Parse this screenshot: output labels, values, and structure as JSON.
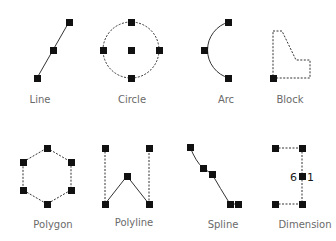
{
  "colors": {
    "background": "#ffffff",
    "stroke": "#333333",
    "grip": "#111111",
    "label": "#6a6a6a"
  },
  "items": [
    {
      "id": "line",
      "label": "Line"
    },
    {
      "id": "circle",
      "label": "Circle"
    },
    {
      "id": "arc",
      "label": "Arc"
    },
    {
      "id": "block",
      "label": "Block"
    },
    {
      "id": "polygon",
      "label": "Polygon"
    },
    {
      "id": "polyline",
      "label": "Polyline"
    },
    {
      "id": "spline",
      "label": "Spline"
    },
    {
      "id": "dimension",
      "label": "Dimension",
      "value_text_left": "6",
      "value_text_right": "1"
    }
  ],
  "icons": {
    "grip": "square-grip-handle"
  }
}
